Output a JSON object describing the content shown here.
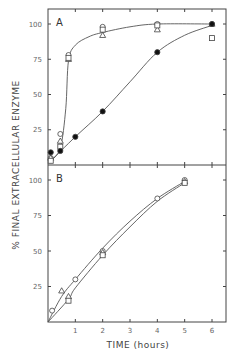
{
  "figure": {
    "ylabel": "% FINAL EXTRACELLULAR ENZYME",
    "xlabel": "TIME (hours)",
    "panel_a_label": "A",
    "panel_b_label": "B",
    "y_ticks": [
      "25",
      "50",
      "75",
      "100"
    ],
    "x_ticks": [
      "1",
      "2",
      "3",
      "4",
      "5",
      "6"
    ]
  },
  "chart_data": [
    {
      "type": "scatter",
      "title": "A",
      "xlabel": "TIME (hours)",
      "ylabel": "% FINAL EXTRACELLULAR ENZYME",
      "xlim": [
        0,
        6.5
      ],
      "ylim": [
        0,
        110
      ],
      "x_ticks": [
        1,
        2,
        3,
        4,
        5,
        6
      ],
      "y_ticks": [
        25,
        50,
        75,
        100
      ],
      "grid": false,
      "series": [
        {
          "name": "open circles",
          "marker": "circle-open",
          "x": [
            0.1,
            0.45,
            0.75,
            2,
            4,
            6
          ],
          "y": [
            5,
            22,
            78,
            98,
            100,
            100
          ]
        },
        {
          "name": "open triangles",
          "marker": "triangle-open",
          "x": [
            0.1,
            0.45,
            0.75,
            2,
            4,
            6
          ],
          "y": [
            5,
            17,
            75,
            92,
            96,
            100
          ]
        },
        {
          "name": "open squares",
          "marker": "square-open",
          "x": [
            0.1,
            0.45,
            0.75,
            2,
            4,
            6
          ],
          "y": [
            3,
            13,
            76,
            96,
            99,
            90
          ]
        },
        {
          "name": "filled circles",
          "marker": "circle-filled",
          "x": [
            0.1,
            0.45,
            1,
            2,
            4,
            6
          ],
          "y": [
            9,
            10,
            20,
            38,
            80,
            100
          ]
        }
      ]
    },
    {
      "type": "scatter",
      "title": "B",
      "xlabel": "TIME (hours)",
      "ylabel": "% FINAL EXTRACELLULAR ENZYME",
      "xlim": [
        0,
        6.5
      ],
      "ylim": [
        0,
        110
      ],
      "x_ticks": [
        1,
        2,
        3,
        4,
        5,
        6
      ],
      "y_ticks": [
        25,
        50,
        75,
        100
      ],
      "grid": false,
      "series": [
        {
          "name": "open circles",
          "marker": "circle-open",
          "x": [
            0.15,
            1,
            2,
            4,
            5
          ],
          "y": [
            8,
            30,
            50,
            87,
            100
          ]
        },
        {
          "name": "open triangles",
          "marker": "triangle-open",
          "x": [
            0.5,
            0.75,
            2,
            5
          ],
          "y": [
            22,
            18,
            49,
            99
          ]
        },
        {
          "name": "open squares",
          "marker": "square-open",
          "x": [
            0.75,
            2,
            5
          ],
          "y": [
            15,
            47,
            98
          ]
        }
      ]
    }
  ]
}
